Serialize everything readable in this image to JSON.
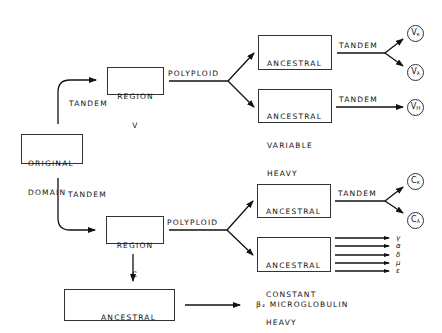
{
  "nodes": {
    "original_domain": {
      "line1": "ORIGINAL",
      "line2": "DOMAIN"
    },
    "region_v": {
      "line1": "REGION",
      "line2": "V"
    },
    "region_c": {
      "line1": "REGION",
      "line2": "C"
    },
    "anc_var_light": {
      "line1": "ANCESTRAL",
      "line2": "VARIABLE",
      "line3": "LIGHT"
    },
    "anc_var_heavy": {
      "line1": "ANCESTRAL",
      "line2": "VARIABLE",
      "line3": "HEAVY"
    },
    "anc_const_light": {
      "line1": "ANCESTRAL",
      "line2": "CONSTANT",
      "line3": "LIGHT"
    },
    "anc_const_heavy": {
      "line1": "ANCESTRAL",
      "line2": "CONSTANT",
      "line3": "HEAVY"
    },
    "anc_b2m": {
      "line1": "ANCESTRAL",
      "line2": "β₂ MICROGLOBULIN"
    },
    "b2m": {
      "label": "β₂ MICROGLOBULIN"
    }
  },
  "edges": {
    "tandem_to_v": "TANDEM",
    "tandem_to_c": "TANDEM",
    "polyploid_v": "POLYPLOID",
    "polyploid_c": "POLYPLOID",
    "tandem_vl": "TANDEM",
    "tandem_vh": "TANDEM",
    "tandem_cl": "TANDEM"
  },
  "terminals": {
    "v_kappa": {
      "base": "V",
      "sub": "κ"
    },
    "v_lambda": {
      "base": "V",
      "sub": "λ"
    },
    "v_heavy": {
      "base": "V",
      "sub": "H"
    },
    "c_kappa": {
      "base": "C",
      "sub": "κ"
    },
    "c_lambda": {
      "base": "C",
      "sub": "λ"
    }
  },
  "heavy_classes": [
    "γ",
    "α",
    "δ",
    "μ",
    "ε"
  ]
}
